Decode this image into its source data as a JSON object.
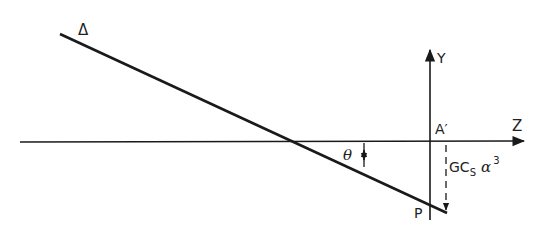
{
  "diagram": {
    "labels": {
      "delta": "Δ",
      "y_axis": "Y",
      "z_axis": "Z",
      "a_prime": "A′",
      "theta": "θ",
      "point_p": "P",
      "displacement_main": "GC",
      "displacement_sub": "S",
      "displacement_alpha": "α",
      "displacement_sup": "3"
    },
    "colors": {
      "stroke": "#1a1a1a",
      "background": "#ffffff"
    }
  }
}
